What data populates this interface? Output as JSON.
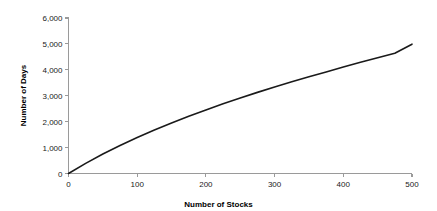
{
  "chart_data": {
    "type": "line",
    "title": "",
    "subtitle": "",
    "xlabel": "Number of Stocks",
    "ylabel": "Number of Days",
    "xlim": [
      0,
      500
    ],
    "ylim": [
      0,
      6000
    ],
    "xticks": [
      0,
      100,
      200,
      300,
      400,
      500
    ],
    "yticks": [
      0,
      1000,
      2000,
      3000,
      4000,
      5000,
      6000
    ],
    "xtick_labels": [
      "0",
      "100",
      "200",
      "300",
      "400",
      "500"
    ],
    "ytick_labels": [
      "0",
      "1,000",
      "2,000",
      "3,000",
      "4,000",
      "5,000",
      "6,000"
    ],
    "grid": false,
    "legend": false,
    "legend_position": "none",
    "annotations": [],
    "series": [
      {
        "name": "Number of Days",
        "color": "#1a1a1a",
        "x": [
          0,
          25,
          50,
          75,
          100,
          125,
          150,
          175,
          200,
          225,
          250,
          275,
          300,
          325,
          350,
          375,
          400,
          425,
          450,
          475,
          500
        ],
        "values": [
          0,
          390,
          750,
          1080,
          1390,
          1680,
          1950,
          2210,
          2450,
          2690,
          2910,
          3130,
          3340,
          3540,
          3730,
          3920,
          4110,
          4290,
          4470,
          4640,
          4990
        ]
      }
    ]
  },
  "style": {
    "axis_color": "#9a9a9a",
    "line_color": "#1a1a1a",
    "text_color": "#1a1a1a",
    "background": "#ffffff"
  }
}
